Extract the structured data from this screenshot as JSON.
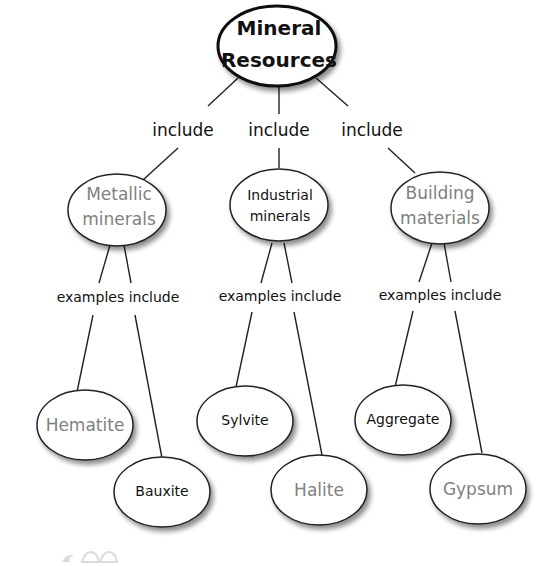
{
  "colors": {
    "primary_text": "#111111",
    "secondary_text": "#808080",
    "line": "#222222",
    "ellipse_fill": "#ffffff"
  },
  "root": {
    "line1": "Mineral",
    "line2": "Resources"
  },
  "link_labels": {
    "include_1": "include",
    "include_2": "include",
    "include_3": "include",
    "examples_1": "examples include",
    "examples_2": "examples include",
    "examples_3": "examples include"
  },
  "categories": [
    {
      "line1": "Metallic",
      "line2": "minerals",
      "style": "gray"
    },
    {
      "line1": "Industrial",
      "line2": "minerals",
      "style": "black"
    },
    {
      "line1": "Building",
      "line2": "materials",
      "style": "gray"
    }
  ],
  "examples": [
    {
      "label": "Hematite",
      "category": "Metallic minerals",
      "style": "gray"
    },
    {
      "label": "Bauxite",
      "category": "Metallic minerals",
      "style": "black"
    },
    {
      "label": "Sylvite",
      "category": "Industrial minerals",
      "style": "black"
    },
    {
      "label": "Halite",
      "category": "Industrial minerals",
      "style": "gray"
    },
    {
      "label": "Aggregate",
      "category": "Building materials",
      "style": "black"
    },
    {
      "label": "Gypsum",
      "category": "Building materials",
      "style": "gray"
    }
  ]
}
